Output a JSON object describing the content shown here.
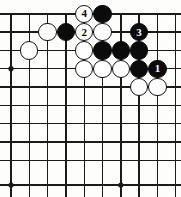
{
  "diagram": {
    "type": "go-board-diagram",
    "board": {
      "grid_columns": 10,
      "grid_rows": 10,
      "partial_view": "top-left corner region, top edge shown",
      "line_color": "#1a1a1a",
      "background_color": "#fdfdfb",
      "edge_line_width_px": 2.6,
      "inner_line_width_px": 1.4,
      "cell_size_px": 18.3,
      "col_x": [
        11,
        29.3,
        47.6,
        65.9,
        84.2,
        102.5,
        120.8,
        139.1,
        157.4,
        175.7
      ],
      "row_y": [
        13.8,
        32.1,
        50.4,
        68.7,
        87.0,
        105.3,
        123.6,
        141.9,
        160.2,
        185.0
      ],
      "top_edge_row": 0,
      "bottom_edge_row": 9,
      "left_edge_col": 0,
      "right_edge_col": 9
    },
    "star_points": [
      {
        "name": "hoshi-left",
        "col": 0,
        "row": 3
      },
      {
        "name": "hoshi-bottom-left",
        "col": 0,
        "row": 9
      },
      {
        "name": "hoshi-bottom-center",
        "col": 6,
        "row": 9
      }
    ],
    "stone_radius_px": 9.2,
    "stones": [
      {
        "id": "w-c2-r1",
        "color": "white",
        "col": 2,
        "row": 1,
        "label": ""
      },
      {
        "id": "b-c3-r1",
        "color": "black",
        "col": 3,
        "row": 1,
        "label": ""
      },
      {
        "id": "w-c4-r0",
        "color": "white",
        "col": 4,
        "row": 0,
        "label": "4"
      },
      {
        "id": "b-c5-r0",
        "color": "black",
        "col": 5,
        "row": 0,
        "label": ""
      },
      {
        "id": "w-c4-r1",
        "color": "white",
        "col": 4,
        "row": 1,
        "label": "2"
      },
      {
        "id": "w-c5-r1",
        "color": "white",
        "col": 5,
        "row": 1,
        "label": ""
      },
      {
        "id": "b-c7-r1",
        "color": "black",
        "col": 7,
        "row": 1,
        "label": "3"
      },
      {
        "id": "w-c1-r2",
        "color": "white",
        "col": 1,
        "row": 2,
        "label": ""
      },
      {
        "id": "w-c4-r2",
        "color": "white",
        "col": 4,
        "row": 2,
        "label": ""
      },
      {
        "id": "b-c5-r2",
        "color": "black",
        "col": 5,
        "row": 2,
        "label": ""
      },
      {
        "id": "b-c6-r2",
        "color": "black",
        "col": 6,
        "row": 2,
        "label": ""
      },
      {
        "id": "b-c7-r2",
        "color": "black",
        "col": 7,
        "row": 2,
        "label": ""
      },
      {
        "id": "w-c4-r3",
        "color": "white",
        "col": 4,
        "row": 3,
        "label": ""
      },
      {
        "id": "w-c5-r3",
        "color": "white",
        "col": 5,
        "row": 3,
        "label": ""
      },
      {
        "id": "w-c6-r3",
        "color": "white",
        "col": 6,
        "row": 3,
        "label": ""
      },
      {
        "id": "b-c7-r3",
        "color": "black",
        "col": 7,
        "row": 3,
        "label": ""
      },
      {
        "id": "b-c8-r3",
        "color": "black",
        "col": 8,
        "row": 3,
        "label": "1"
      },
      {
        "id": "w-c7-r4",
        "color": "white",
        "col": 7,
        "row": 4,
        "label": ""
      },
      {
        "id": "w-c8-r4",
        "color": "white",
        "col": 8,
        "row": 4,
        "label": ""
      }
    ],
    "move_labels": [
      "1",
      "2",
      "3",
      "4"
    ],
    "label_font_size_px": 11
  }
}
